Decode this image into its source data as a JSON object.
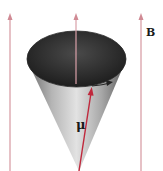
{
  "diagram": {
    "labels": {
      "field": "B",
      "moment": "μ"
    },
    "colors": {
      "field_lines": "#d9a0a8",
      "moment_vector": "#c0283c",
      "cone_light": "#dcdcdc",
      "cone_dark": "#555555",
      "cone_interior": "#3a3a3a",
      "precession_arrow": "#222222"
    },
    "field_lines_x": [
      10,
      76,
      141
    ]
  }
}
